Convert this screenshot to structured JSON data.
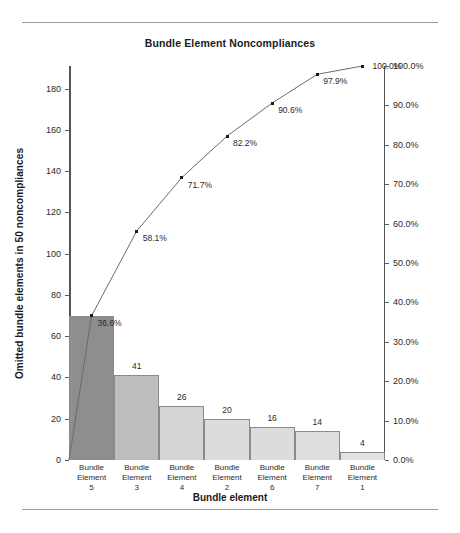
{
  "chart_data": {
    "type": "bar",
    "title": "Bundle Element Noncompliances",
    "xlabel": "Bundle element",
    "ylabel": "Omitted bundle elements in 50 noncompliances",
    "y2label": "",
    "categories": [
      "Bundle Element 5",
      "Bundle Element 3",
      "Bundle Element 4",
      "Bundle Element 2",
      "Bundle Element 6",
      "Bundle Element 7",
      "Bundle Element 1"
    ],
    "category_parts": [
      {
        "name": "Bundle Element",
        "number": "5"
      },
      {
        "name": "Bundle Element",
        "number": "3"
      },
      {
        "name": "Bundle Element",
        "number": "4"
      },
      {
        "name": "Bundle Element",
        "number": "2"
      },
      {
        "name": "Bundle Element",
        "number": "6"
      },
      {
        "name": "Bundle Element",
        "number": "7"
      },
      {
        "name": "Bundle Element",
        "number": "1"
      }
    ],
    "values": [
      70,
      41,
      26,
      20,
      16,
      14,
      4
    ],
    "value_labels": [
      "",
      "41",
      "26",
      "20",
      "16",
      "14",
      "4"
    ],
    "cumulative_percent": [
      36.6,
      58.1,
      71.7,
      82.2,
      90.6,
      97.9,
      100.0
    ],
    "cumulative_labels": [
      "36.6%",
      "58.1%",
      "71.7%",
      "82.2%",
      "90.6%",
      "97.9%",
      "100.0%"
    ],
    "total": 191,
    "ylim": [
      0,
      191
    ],
    "y2lim": [
      0,
      100
    ],
    "yticks": [
      0,
      20,
      40,
      60,
      80,
      100,
      120,
      140,
      160,
      180
    ],
    "ytick_labels": [
      "0",
      "20",
      "40",
      "60",
      "80",
      "100",
      "120",
      "140",
      "160",
      "180"
    ],
    "y2ticks": [
      0,
      10,
      20,
      30,
      40,
      50,
      60,
      70,
      80,
      90,
      100
    ],
    "y2tick_labels": [
      "0.0%",
      "10.0%",
      "20.0%",
      "30.0%",
      "40.0%",
      "50.0%",
      "60.0%",
      "70.0%",
      "80.0%",
      "90.0%",
      "100.0%"
    ],
    "grid": false,
    "legend": "none",
    "bar_colors": [
      "#8e8e8e",
      "#bdbdbd",
      "#d5d5d5",
      "#dcdcdc",
      "#dcdcdc",
      "#dedede",
      "#e2e2e2"
    ],
    "bar_edge_color": "#8a8a8a",
    "line_color": "#6b6b6b",
    "marker_color": "#1b1b1b",
    "axis_color": "#555555",
    "text_color": "#231f20"
  }
}
